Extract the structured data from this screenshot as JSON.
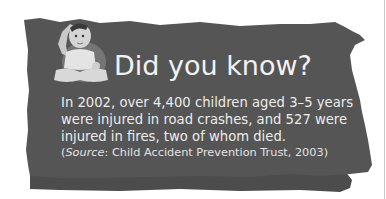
{
  "colors": {
    "panel": "#555555",
    "panel_shadow": "#4a4a4a",
    "text": "#f0f0f0",
    "background": "#ffffff"
  },
  "callout": {
    "title": "Did you know?",
    "image": "baby-photo",
    "body_lines": [
      "In 2002, over 4,400 children aged 3–5 years",
      "were injured in road crashes, and 527 were",
      "injured in fires, two of whom died."
    ],
    "source": {
      "open": "(",
      "label": "Source",
      "text": ": Child Accident Prevention Trust, 2003)"
    }
  }
}
